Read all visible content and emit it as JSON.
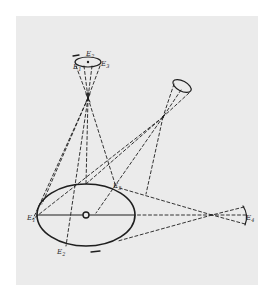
{
  "diagram": {
    "type": "hand-drawn geometric sketch",
    "colors": {
      "background": "#ffffff",
      "paper": "#ebebeb",
      "ink": "#1e1e1e"
    },
    "main_ellipse": {
      "center": [
        86,
        215
      ],
      "rx": 49,
      "ry": 31,
      "center_marker": "small ring"
    },
    "apertures": [
      {
        "id": "top",
        "center": [
          88,
          62
        ],
        "rx": 13,
        "ry": 5,
        "rotation": 0,
        "crossing_point": [
          88,
          98
        ]
      },
      {
        "id": "upper-right",
        "center": [
          182,
          86
        ],
        "rx": 10,
        "ry": 5,
        "rotation": 28,
        "crossing_point": [
          163,
          117
        ]
      },
      {
        "id": "right",
        "center": [
          245,
          215
        ],
        "kind": "arc cap",
        "crossing_point": [
          212,
          215
        ]
      }
    ],
    "labels": [
      {
        "id": "label-top-left",
        "text": "E",
        "sub": "1",
        "pos": [
          75,
          67
        ]
      },
      {
        "id": "label-top-mid",
        "text": "E",
        "sub": "2",
        "pos": [
          88,
          56
        ]
      },
      {
        "id": "label-top-right",
        "text": "E",
        "sub": "3",
        "pos": [
          102,
          66
        ]
      },
      {
        "id": "label-ellipse-left",
        "text": "E",
        "sub": "1",
        "pos": [
          30,
          219
        ]
      },
      {
        "id": "label-ellipse-top",
        "text": "E",
        "sub": "3",
        "pos": [
          114,
          189
        ]
      },
      {
        "id": "label-ellipse-bottom",
        "text": "E",
        "sub": "2",
        "pos": [
          58,
          252
        ]
      },
      {
        "id": "label-right-cap",
        "text": "E",
        "sub": "4",
        "pos": [
          246,
          219
        ]
      }
    ],
    "marks": [
      {
        "id": "dash-top",
        "text": "—",
        "pos": [
          74,
          55
        ]
      },
      {
        "id": "dash-bottom",
        "text": "—",
        "pos": [
          94,
          252
        ]
      }
    ]
  }
}
